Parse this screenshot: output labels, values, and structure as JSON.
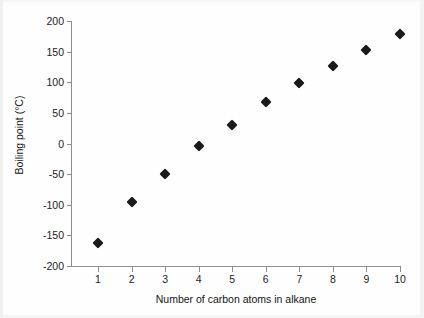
{
  "chart_data": {
    "type": "scatter",
    "title": "",
    "xlabel": "Number of carbon atoms in alkane",
    "ylabel": "Boiling point (°C)",
    "x": [
      1,
      2,
      3,
      4,
      5,
      6,
      7,
      8,
      9,
      10
    ],
    "values": [
      -162,
      -95,
      -49,
      -4,
      31,
      67,
      98,
      127,
      153,
      178
    ],
    "series": [
      {
        "name": "Boiling point",
        "values": [
          -162,
          -95,
          -49,
          -4,
          31,
          67,
          98,
          127,
          153,
          178
        ]
      }
    ],
    "xlim": [
      0.55,
      10.45
    ],
    "ylim": [
      -200,
      200
    ],
    "xticks": [
      1,
      2,
      3,
      4,
      5,
      6,
      7,
      8,
      9,
      10
    ],
    "xtick_labels": [
      "1",
      "2",
      "3",
      "4",
      "5",
      "6",
      "7",
      "8",
      "9",
      "10"
    ],
    "yticks": [
      200,
      150,
      100,
      50,
      0,
      -50,
      -100,
      -150,
      -200
    ],
    "ytick_labels": [
      "200",
      "150",
      "100",
      "50",
      "0",
      "-50",
      "-100",
      "-150",
      "-200"
    ],
    "grid": false,
    "legend": null,
    "legend_position": "none",
    "marker": "diamond",
    "marker_color": "#1a1a1a",
    "axis_color": "#8d8d8d",
    "background_color": "#ffffff"
  }
}
